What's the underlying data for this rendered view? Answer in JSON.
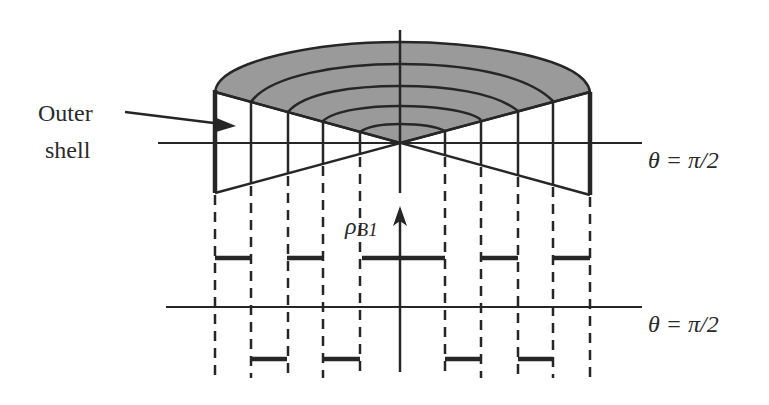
{
  "labels": {
    "outer_shell_line1": "Outer",
    "outer_shell_line2": "shell",
    "theta_upper": "θ = π/2",
    "theta_lower": "θ = π/2",
    "rho_symbol": "ρ",
    "rho_subscript": "B1"
  },
  "colors": {
    "stroke": "#262626",
    "fill_shaded": "#9a9a9a",
    "background": "#ffffff"
  },
  "geometry": {
    "apex": [
      400,
      143
    ],
    "outer_left_x": 215,
    "outer_right_x": 590,
    "shell_x_left": [
      215,
      251,
      288,
      323,
      360
    ],
    "shell_x_right": [
      445,
      481,
      518,
      553,
      590
    ],
    "upper_step_bars": [
      [
        215,
        251
      ],
      [
        287,
        323
      ],
      [
        362,
        445
      ],
      [
        482,
        518
      ],
      [
        553,
        590
      ]
    ],
    "lower_step_bars": [
      [
        251,
        287
      ],
      [
        324,
        360
      ],
      [
        445,
        482
      ],
      [
        518,
        553
      ]
    ]
  }
}
